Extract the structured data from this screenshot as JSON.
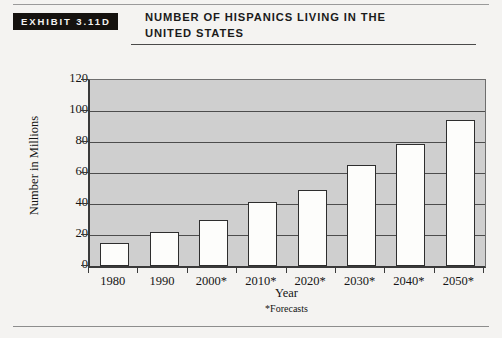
{
  "exhibit": {
    "tag": "EXHIBIT 3.11D",
    "title_line1": "Number of Hispanics Living in the",
    "title_line2": "United States"
  },
  "chart_data": {
    "type": "bar",
    "title": "Number of Hispanics Living in the United States",
    "subtitle": "",
    "xlabel": "Year",
    "ylabel": "Number in Millions",
    "categories": [
      "1980",
      "1990",
      "2000*",
      "2010*",
      "2020*",
      "2030*",
      "2040*",
      "2050*"
    ],
    "values": [
      15,
      22,
      30,
      41,
      49,
      65,
      79,
      94
    ],
    "ylim": [
      0,
      120
    ],
    "ytick_labels": [
      "0",
      "20",
      "40",
      "60",
      "80",
      "100",
      "120"
    ],
    "ytick_values": [
      0,
      20,
      40,
      60,
      80,
      100,
      120
    ],
    "grid": true,
    "legend": "none",
    "annotation": "*Forecasts",
    "bar_fill_color": "#fdfdfb",
    "bar_edge_color": "#2e2e2e",
    "plot_background_color": "#cfcfcf",
    "axis_color": "#3a3a3a"
  },
  "footnote": "*Forecasts"
}
